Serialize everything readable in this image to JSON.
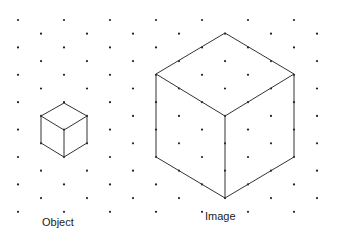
{
  "labels": {
    "object": "Object",
    "image": "Image"
  },
  "grid": {
    "x0": 18,
    "dx": 23,
    "y0": 20,
    "dy": 13.7,
    "rows": 15,
    "cols": 14,
    "dot_color": "#222222"
  },
  "object_cube": {
    "top": [
      64,
      103
    ],
    "left": [
      41,
      116
    ],
    "right": [
      87,
      116
    ],
    "center": [
      64,
      130
    ],
    "bottom": [
      64,
      157
    ],
    "lower_left": [
      41,
      143
    ],
    "lower_right": [
      87,
      143
    ]
  },
  "image_cube": {
    "top": [
      225,
      33
    ],
    "left": [
      156,
      74
    ],
    "right": [
      294,
      74
    ],
    "center": [
      225,
      116
    ],
    "bottom": [
      225,
      198
    ],
    "lower_left": [
      156,
      157
    ],
    "lower_right": [
      294,
      157
    ]
  },
  "line_color": "#333333"
}
